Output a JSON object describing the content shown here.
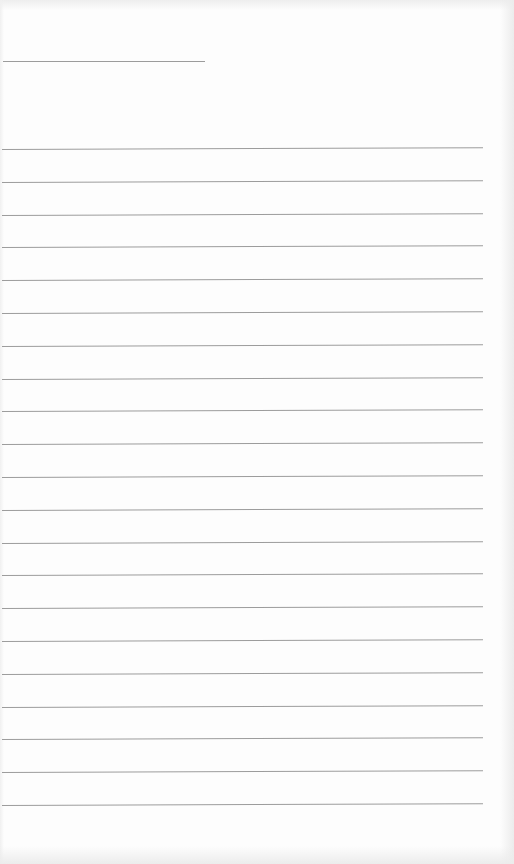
{
  "document": {
    "type": "lined-paper",
    "text": "",
    "title_line": {
      "x": 3,
      "y": 61,
      "width": 202
    },
    "rules": {
      "count": 21,
      "first_y": 149,
      "spacing": 32.8,
      "x_start": 2,
      "x_end": 483
    },
    "colors": {
      "paper": "#fdfdfd",
      "rule": "#9c9c9c",
      "scan_edge": "#ececec"
    }
  }
}
